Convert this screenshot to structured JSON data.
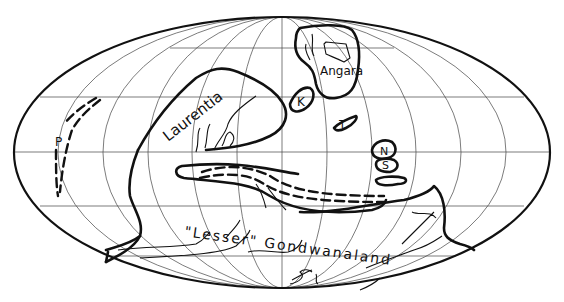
{
  "map": {
    "projection": "Mollweide (world ellipse)",
    "labels": {
      "laurentia": "Laurentia",
      "angara": "Angara",
      "k": "K",
      "t": "T",
      "n": "N",
      "s": "S",
      "p": "P",
      "gondwana": "\"Lesser\" Gondwanaland"
    },
    "colors": {
      "ink": "#111111",
      "background": "#ffffff",
      "grid": "#444444"
    }
  }
}
